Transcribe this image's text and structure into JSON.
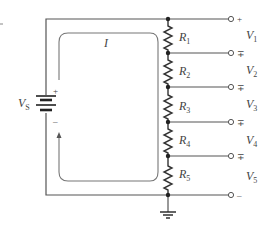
{
  "diagram": {
    "type": "voltage-divider-circuit",
    "source": {
      "label": "V",
      "subscript": "S",
      "plus_sign": "+",
      "minus_sign": "–"
    },
    "current": {
      "label": "I"
    },
    "resistors": [
      {
        "label": "R",
        "subscript": "1"
      },
      {
        "label": "R",
        "subscript": "2"
      },
      {
        "label": "R",
        "subscript": "3"
      },
      {
        "label": "R",
        "subscript": "4"
      },
      {
        "label": "R",
        "subscript": "5"
      }
    ],
    "outputs": [
      {
        "label": "V",
        "subscript": "1",
        "top_sign": "+",
        "bottom_sign": "–"
      },
      {
        "label": "V",
        "subscript": "2",
        "top_sign": "+",
        "bottom_sign": "–"
      },
      {
        "label": "V",
        "subscript": "3",
        "top_sign": "+",
        "bottom_sign": "–"
      },
      {
        "label": "V",
        "subscript": "4",
        "top_sign": "+",
        "bottom_sign": "–"
      },
      {
        "label": "V",
        "subscript": "5",
        "top_sign": "+",
        "bottom_sign": "–"
      }
    ],
    "terminal_signs": [
      "+",
      "∓",
      "∓",
      "∓",
      "∓",
      "–"
    ],
    "ground": {
      "symbol": "ground-icon"
    },
    "colors": {
      "wire": "#555555",
      "loop": "#777777",
      "text": "#444444",
      "background": "#ffffff"
    }
  }
}
